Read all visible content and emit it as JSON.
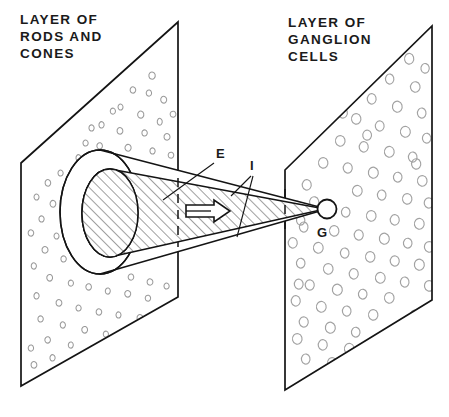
{
  "figure": {
    "background_color": "#ffffff",
    "ink_color": "#141414",
    "speckle_color": "#9a9a9a",
    "width": 449,
    "height": 417
  },
  "labels": {
    "left_plane_heading": {
      "lines": [
        "LAYER OF",
        "RODS AND",
        "CONES"
      ],
      "line1": "LAYER OF",
      "line2": "RODS AND",
      "line3": "CONES",
      "x": 20,
      "y": 30
    },
    "right_plane_heading": {
      "lines": [
        "LAYER OF",
        "GANGLION",
        "CELLS"
      ],
      "line1": "LAYER OF",
      "line2": "GANGLION",
      "line3": "CELLS",
      "x": 288,
      "y": 33
    },
    "markers": [
      {
        "id": "E",
        "text": "E",
        "x": 216,
        "y": 158,
        "meaning": "excitatory-outer-cone"
      },
      {
        "id": "I",
        "text": "I",
        "x": 250,
        "y": 170,
        "meaning": "inhibitory-inner-cone"
      },
      {
        "id": "G",
        "text": "G",
        "x": 317,
        "y": 237,
        "meaning": "ganglion-cell"
      }
    ]
  },
  "planes": {
    "left": {
      "name": "layer-of-rods-and-cones-plane",
      "points": "178,22 178,297 21,386 21,163",
      "speckle_style": "small-sparse-crescents",
      "speckle_count": 62
    },
    "right": {
      "name": "layer-of-ganglion-cells-plane",
      "points": "432,26 432,300 285,390 285,170",
      "speckle_style": "large-dense-rings",
      "speckle_count": 96
    }
  },
  "cone": {
    "outer": {
      "name": "outer-cone-E",
      "apex_x": 327,
      "apex_y": 209,
      "base_center_x": 100,
      "base_center_y": 212,
      "base_rx": 40,
      "base_ry": 62,
      "fill": "#ffffff"
    },
    "inner": {
      "name": "inner-hatched-cone-I",
      "apex_x": 325,
      "apex_y": 209,
      "base_center_x": 110,
      "base_center_y": 213,
      "base_rx": 28,
      "base_ry": 44,
      "hatched": true,
      "hatch_angle_deg": 45
    },
    "ganglion_circle": {
      "name": "ganglion-cell-circle-G",
      "cx": 327,
      "cy": 209,
      "r": 9.5
    },
    "direction_arrow": {
      "name": "direction-of-impulse-arrow",
      "x": 186,
      "y": 211,
      "length": 42,
      "points_right": true
    }
  }
}
